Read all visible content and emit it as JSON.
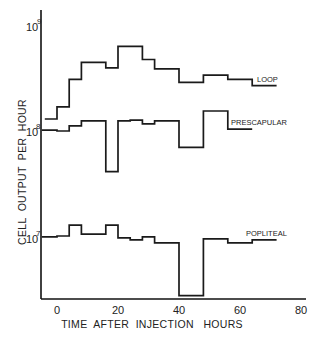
{
  "chart_data": {
    "type": "line",
    "style": "step",
    "title": "",
    "xlabel": "TIME  AFTER  INJECTION   HOURS",
    "ylabel": "CELL  OUTPUT  PER  HOUR",
    "xlim": [
      -4,
      80
    ],
    "ylim": [
      1000000,
      1000000000
    ],
    "yscale": "log",
    "x_ticks": [
      0,
      20,
      40,
      60,
      80
    ],
    "x_tick_labels": [
      "0",
      "20",
      "40",
      "60",
      "80"
    ],
    "y_ticks": [
      10000000,
      100000000,
      1000000000
    ],
    "y_tick_labels": [
      {
        "base": "10",
        "exp": "7"
      },
      {
        "base": "10",
        "exp": "8"
      },
      {
        "base": "10",
        "exp": "9"
      }
    ],
    "grid": false,
    "legend": "inline labels at right end of each series",
    "series": [
      {
        "name": "LOOP",
        "x_edges": [
          -4,
          0,
          4,
          8,
          16,
          20,
          28,
          32,
          40,
          48,
          56,
          64,
          72
        ],
        "values": [
          130000000,
          170000000,
          310000000,
          450000000,
          400000000,
          640000000,
          480000000,
          390000000,
          290000000,
          340000000,
          310000000,
          270000000
        ]
      },
      {
        "name": "PRESCAPULAR",
        "x_edges": [
          -5,
          0,
          4,
          8,
          16,
          20,
          24,
          28,
          32,
          40,
          48,
          56,
          64
        ],
        "values": [
          102000000,
          100000000,
          112000000,
          125000000,
          41000000,
          125000000,
          127000000,
          117000000,
          125000000,
          70000000,
          155000000,
          104000000
        ]
      },
      {
        "name": "POPLITEAL",
        "x_edges": [
          -5,
          0,
          4,
          8,
          16,
          20,
          24,
          28,
          32,
          40,
          48,
          56,
          64,
          72
        ],
        "values": [
          9800000,
          10000000,
          12700000,
          10400000,
          12700000,
          9600000,
          9200000,
          9800000,
          8600000,
          2700000,
          9400000,
          8600000,
          9200000
        ]
      }
    ]
  },
  "layout": {
    "plot": {
      "x0_px": 57,
      "px_per_hour": 3.05,
      "y_axis_px": 41,
      "x_axis_px": 299,
      "axis_top_px": 10,
      "decade_px": 105,
      "y_1e8_px": 131
    }
  }
}
